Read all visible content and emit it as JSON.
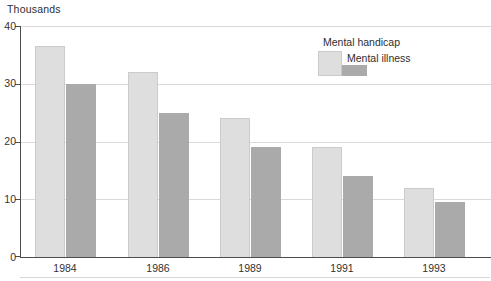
{
  "title": "Thousands",
  "chart_data": {
    "type": "bar",
    "title": "",
    "xlabel": "",
    "ylabel": "Thousands",
    "categories": [
      "1984",
      "1986",
      "1989",
      "1991",
      "1993"
    ],
    "series": [
      {
        "name": "Mental handicap",
        "color": "#dedede",
        "values": [
          36.5,
          32,
          24,
          19,
          12
        ]
      },
      {
        "name": "Mental illness",
        "color": "#aaaaaa",
        "values": [
          30,
          25,
          19,
          14,
          9.5
        ]
      }
    ],
    "ylim": [
      0,
      40
    ],
    "yticks": [
      0,
      10,
      20,
      30,
      40
    ],
    "grid": true,
    "grid_color": "#d9d9d9",
    "axis_color": "#4d4d4d",
    "legend_position": "top-right",
    "legend_order": [
      "Mental handicap",
      "Mental illness"
    ]
  },
  "colors": {
    "background": "#ffffff",
    "text": "#333333"
  }
}
